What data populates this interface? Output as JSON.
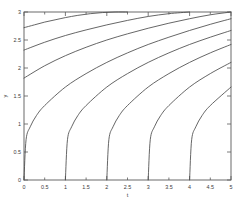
{
  "chart_data": {
    "type": "line",
    "title": "",
    "subtitle": "",
    "xlabel": "t",
    "ylabel": "y",
    "xlim": [
      0,
      5
    ],
    "ylim": [
      0,
      3
    ],
    "xticks": [
      0,
      0.5,
      1,
      1.5,
      2,
      2.5,
      3,
      3.5,
      4,
      4.5,
      5
    ],
    "xticklabels": [
      "0",
      "0.5",
      "1",
      "1.5",
      "2",
      "2.5",
      "3",
      "3.5",
      "4",
      "4.5",
      "5"
    ],
    "yticks": [
      0,
      0.5,
      1,
      1.5,
      2,
      2.5,
      3
    ],
    "yticklabels": [
      "0",
      "0.5",
      "1",
      "1.5",
      "2",
      "2.5",
      "3"
    ],
    "grid": false,
    "legend": false,
    "legend_position": "none",
    "box": true,
    "annotations": [],
    "series": [
      {
        "name": "c = -3",
        "shift": -3,
        "color": "#4a4a4a",
        "y_at_t0": 2.72,
        "x": [
          0,
          0.25,
          0.5,
          0.75,
          1,
          1.3,
          1.6,
          1.9,
          2.2,
          2.5
        ],
        "values": [
          2.72,
          2.77,
          2.82,
          2.86,
          2.9,
          2.94,
          2.97,
          2.99,
          3.0,
          3.0
        ]
      },
      {
        "name": "c = -2",
        "shift": -2,
        "color": "#4a4a4a",
        "y_at_t0": 2.32,
        "x": [
          0,
          0.5,
          1,
          1.5,
          2,
          2.5,
          3,
          3.5,
          4
        ],
        "values": [
          2.32,
          2.46,
          2.58,
          2.68,
          2.77,
          2.85,
          2.92,
          2.97,
          3.0
        ]
      },
      {
        "name": "c = -1",
        "shift": -1,
        "color": "#4a4a4a",
        "y_at_t0": 1.82,
        "x": [
          0,
          0.5,
          1,
          1.5,
          2,
          2.5,
          3,
          3.5,
          4,
          4.5,
          5
        ],
        "values": [
          1.82,
          2.04,
          2.22,
          2.37,
          2.5,
          2.61,
          2.71,
          2.8,
          2.88,
          2.95,
          3.0
        ]
      },
      {
        "name": "c = 0",
        "shift": 0,
        "color": "#4a4a4a",
        "y_at_t0": 0.0,
        "x": [
          0,
          0.05,
          0.15,
          0.3,
          0.5,
          1,
          1.5,
          2,
          2.5,
          3,
          3.5,
          4,
          4.5,
          5
        ],
        "values": [
          0.0,
          0.72,
          0.95,
          1.15,
          1.33,
          1.66,
          1.9,
          2.1,
          2.27,
          2.42,
          2.55,
          2.67,
          2.78,
          2.88
        ]
      },
      {
        "name": "c = 1",
        "shift": 1,
        "color": "#4a4a4a",
        "y_at_t0": null,
        "x": [
          1,
          1.05,
          1.15,
          1.3,
          1.5,
          2,
          2.5,
          3,
          3.5,
          4,
          4.5,
          5
        ],
        "values": [
          0.0,
          0.72,
          0.95,
          1.15,
          1.33,
          1.66,
          1.9,
          2.1,
          2.27,
          2.42,
          2.55,
          2.67
        ]
      },
      {
        "name": "c = 2",
        "shift": 2,
        "color": "#4a4a4a",
        "y_at_t0": null,
        "x": [
          2,
          2.05,
          2.15,
          2.3,
          2.5,
          3,
          3.5,
          4,
          4.5,
          5
        ],
        "values": [
          0.0,
          0.72,
          0.95,
          1.15,
          1.33,
          1.66,
          1.9,
          2.1,
          2.27,
          2.42
        ]
      },
      {
        "name": "c = 3",
        "shift": 3,
        "color": "#4a4a4a",
        "y_at_t0": null,
        "x": [
          3,
          3.05,
          3.15,
          3.3,
          3.5,
          4,
          4.5,
          5
        ],
        "values": [
          0.0,
          0.72,
          0.95,
          1.15,
          1.33,
          1.66,
          1.9,
          2.1
        ]
      },
      {
        "name": "c = 4",
        "shift": 4,
        "color": "#4a4a4a",
        "y_at_t0": null,
        "x": [
          4,
          4.05,
          4.15,
          4.3,
          4.5,
          5
        ],
        "values": [
          0.0,
          0.72,
          0.95,
          1.15,
          1.33,
          1.66
        ]
      }
    ]
  },
  "figure": {
    "background_color": "#ffffff",
    "axis_color": "#5a5a5a",
    "curve_color": "#4a4a4a"
  }
}
